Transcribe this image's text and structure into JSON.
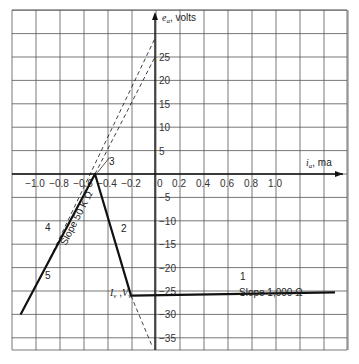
{
  "chart_data": {
    "type": "line",
    "title": "",
    "xlabel": "i_a, ma",
    "ylabel": "e_a, volts",
    "xlim": [
      -1.2,
      1.6
    ],
    "ylim": [
      -38,
      30
    ],
    "grid": true,
    "x_ticks": [
      "-1.0",
      "-0.8",
      "-0.6",
      "-0.4",
      "-0.2",
      "0",
      "0.2",
      "0.4",
      "0.6",
      "0.8",
      "1.0"
    ],
    "y_ticks": [
      "25",
      "20",
      "15",
      "10",
      "5",
      "-5",
      "-10",
      "-15",
      "-20",
      "-25",
      "-30",
      "-35"
    ],
    "series": [
      {
        "name": "characteristic",
        "style": "solid-bold",
        "points": [
          [
            -1.12,
            -30
          ],
          [
            -0.5,
            0
          ],
          [
            -0.2,
            -26
          ],
          [
            1.5,
            -25.3
          ]
        ]
      },
      {
        "name": "dashed-line-4",
        "style": "dashed",
        "points": [
          [
            -0.95,
            -22
          ],
          [
            0,
            29
          ]
        ]
      },
      {
        "name": "dashed-line-3",
        "style": "dashed",
        "points": [
          [
            -0.5,
            0
          ],
          [
            0,
            25
          ]
        ]
      },
      {
        "name": "dashed-extension-2",
        "style": "dashed",
        "points": [
          [
            -0.2,
            -26
          ],
          [
            -0.02,
            -37
          ]
        ]
      }
    ],
    "annotations": [
      {
        "text": "1",
        "at": [
          0.75,
          -24
        ]
      },
      {
        "text": "2",
        "at": [
          -0.27,
          -10
        ]
      },
      {
        "text": "3",
        "at": [
          -0.42,
          2.5
        ]
      },
      {
        "text": "4",
        "at": [
          -0.88,
          -10
        ]
      },
      {
        "text": "5",
        "at": [
          -0.88,
          -22
        ]
      },
      {
        "text": "Slope 50 K Ω",
        "at": [
          -0.7,
          -12
        ],
        "rotated": true
      },
      {
        "text": "Slope 1,000 Ω",
        "at": [
          0.8,
          -27
        ]
      },
      {
        "text": "I_v ,V_v",
        "at": [
          -0.3,
          -25.5
        ]
      }
    ]
  },
  "labels": {
    "y_axis": "e",
    "y_axis_sub": "a",
    "y_axis_unit": ", volts",
    "x_axis": "i",
    "x_axis_sub": "a",
    "x_axis_unit": ", ma",
    "slope1": "Slope 1,000 Ω",
    "slope2": "Slope 50 K Ω",
    "seg1": "1",
    "seg2": "2",
    "seg3": "3",
    "seg4": "4",
    "seg5": "5",
    "valley_I": "I",
    "valley_V": "V",
    "valley_sub": "v",
    "valley_sep": " ,"
  }
}
